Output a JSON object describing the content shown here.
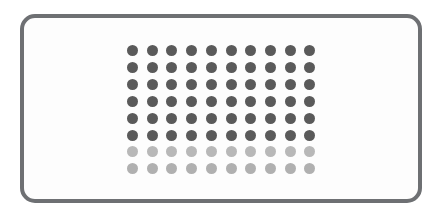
{
  "canvas": {
    "width": 446,
    "height": 217,
    "background_color": "#ffffff"
  },
  "panel": {
    "label": "rounded-rectangle-frame",
    "border_color": "#6e7073",
    "fill_color": "#fdfdfd",
    "border_width_px": 4,
    "corner_radius_px": 15,
    "left_px": 20,
    "top_px": 14,
    "width_px": 402,
    "height_px": 189
  },
  "dot_matrix": {
    "label": "dot-grid",
    "columns": 10,
    "rows": 8,
    "dot_diameter_px": 11,
    "column_spacing_px": 19.7,
    "row_spacing_px": 16.9,
    "origin_x_px": 127,
    "origin_y_px": 45,
    "dark_color": "#5a5a5a",
    "light_color": "#b4b4b4",
    "row_colors": [
      "#5a5a5a",
      "#5a5a5a",
      "#5a5a5a",
      "#5a5a5a",
      "#5a5a5a",
      "#5a5a5a",
      "#b8b8b8",
      "#b0b0b0"
    ],
    "row_states": [
      "filled",
      "filled",
      "filled",
      "filled",
      "filled",
      "filled",
      "dimmed",
      "dimmed"
    ]
  }
}
